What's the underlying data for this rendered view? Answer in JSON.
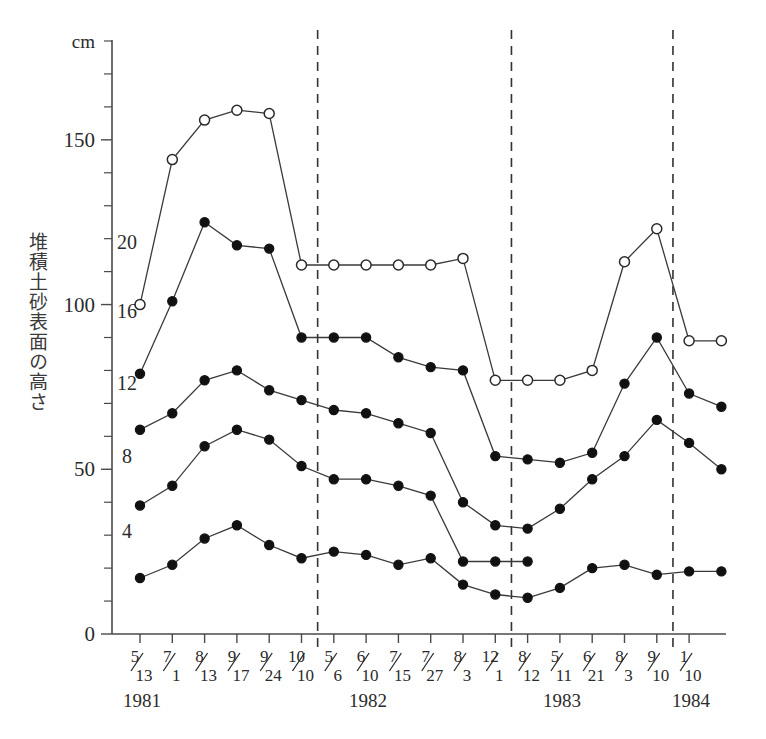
{
  "chart_data": {
    "type": "line",
    "title": "",
    "xlabel": "",
    "ylabel": "堆積土砂表面の高さ",
    "unit_label": "cm",
    "ylim": [
      0,
      180
    ],
    "ytick_values": [
      0,
      50,
      100,
      150
    ],
    "ytick_labels": [
      "0",
      "50",
      "100",
      "150"
    ],
    "yminor_step": 10,
    "grid": false,
    "legend_position": "inline-left",
    "x_categories": [
      "5/13",
      "7/1",
      "8/13",
      "9/17",
      "9/24",
      "10/10",
      "5/6",
      "6/10",
      "7/15",
      "7/27",
      "8/3",
      "12/1",
      "8/12",
      "5/11",
      "6/21",
      "8/3",
      "9/10",
      "1/10"
    ],
    "x_tick_labels": [
      {
        "num": "5",
        "den": "13"
      },
      {
        "num": "7",
        "den": "1"
      },
      {
        "num": "8",
        "den": "13"
      },
      {
        "num": "9",
        "den": "17"
      },
      {
        "num": "9",
        "den": "24"
      },
      {
        "num": "10",
        "den": "10"
      },
      {
        "num": "5",
        "den": "6"
      },
      {
        "num": "6",
        "den": "10"
      },
      {
        "num": "7",
        "den": "15"
      },
      {
        "num": "7",
        "den": "27"
      },
      {
        "num": "8",
        "den": "3"
      },
      {
        "num": "12",
        "den": "1"
      },
      {
        "num": "8",
        "den": "12"
      },
      {
        "num": "5",
        "den": "11"
      },
      {
        "num": "6",
        "den": "21"
      },
      {
        "num": "8",
        "den": "3"
      },
      {
        "num": "9",
        "den": "10"
      },
      {
        "num": "1",
        "den": "10"
      }
    ],
    "year_labels": [
      {
        "text": "1981",
        "index": 0
      },
      {
        "text": "1982",
        "index": 7
      },
      {
        "text": "1983",
        "index": 13
      },
      {
        "text": "1984",
        "index": 17
      }
    ],
    "separators": [
      {
        "after_index": 5,
        "label": "1981/1982"
      },
      {
        "after_index": 11,
        "label": "1982/1983"
      },
      {
        "after_index": 16,
        "label": "1983/1984"
      }
    ],
    "series": [
      {
        "name": "20",
        "marker": "open-circle",
        "label": "20",
        "values": [
          100,
          144,
          156,
          159,
          158,
          112,
          112,
          112,
          112,
          112,
          114,
          77,
          77,
          77,
          80,
          113,
          123,
          89,
          89
        ]
      },
      {
        "name": "16",
        "marker": "filled-circle",
        "label": "16",
        "values": [
          79,
          101,
          125,
          118,
          117,
          90,
          90,
          90,
          84,
          81,
          80,
          54,
          53,
          52,
          55,
          76,
          90,
          73,
          69
        ]
      },
      {
        "name": "12",
        "marker": "filled-circle",
        "label": "12",
        "values": [
          62,
          67,
          77,
          80,
          74,
          71,
          68,
          67,
          64,
          61,
          40,
          33,
          32,
          38,
          47,
          54,
          65,
          58,
          50
        ]
      },
      {
        "name": "8",
        "marker": "filled-circle",
        "label": "8",
        "values": [
          39,
          45,
          57,
          62,
          59,
          51,
          47,
          47,
          45,
          42,
          22,
          22,
          22,
          null,
          null,
          null,
          null,
          null,
          null
        ]
      },
      {
        "name": "4",
        "marker": "filled-circle",
        "label": "4",
        "values": [
          17,
          21,
          29,
          33,
          27,
          23,
          25,
          24,
          21,
          23,
          15,
          12,
          11,
          14,
          20,
          21,
          18,
          19,
          19
        ]
      }
    ],
    "series_label_positions": [
      {
        "label": "20",
        "value": 117
      },
      {
        "label": "16",
        "value": 96
      },
      {
        "label": "12",
        "value": 74
      },
      {
        "label": "8",
        "value": 52
      },
      {
        "label": "4",
        "value": 29
      }
    ]
  },
  "caption": {
    "text": ""
  },
  "colors": {
    "axis": "#4a4a4a",
    "line": "#3a3a3a",
    "marker_fill": "#111111",
    "marker_open": "#ffffff",
    "separator": "#333333",
    "text": "#2b2b2b",
    "background": "#ffffff"
  }
}
